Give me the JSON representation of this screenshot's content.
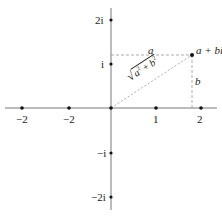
{
  "diagram": {
    "type": "complex-plane",
    "colors": {
      "axis": "#555555",
      "point": "#111111",
      "dashed": "#999999",
      "text": "#222222"
    },
    "x_ticks": [
      {
        "label": "−2",
        "x": 22
      },
      {
        "label": "−2",
        "x": 69
      },
      {
        "label": "1",
        "x": 156
      },
      {
        "label": "2",
        "x": 201
      }
    ],
    "y_ticks": [
      {
        "label": "2i",
        "y": 20
      },
      {
        "label": "i",
        "y": 64
      },
      {
        "label": "−i",
        "y": 153
      },
      {
        "label": "−2i",
        "y": 197
      }
    ],
    "point_label": "a + bi",
    "horizontal_label": "a",
    "vertical_label": "b",
    "hypotenuse_label": "√(a² + b²)",
    "hyp_a": "a",
    "hyp_b": "b",
    "hyp_exp": "2",
    "hyp_plus": " + "
  }
}
